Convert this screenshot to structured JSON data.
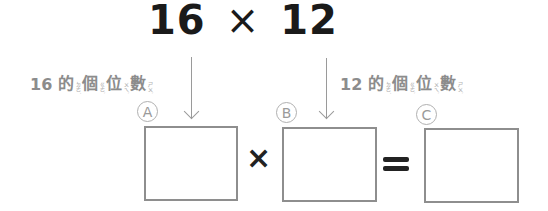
{
  "title": {
    "left": "16",
    "operator": "×",
    "right": "12"
  },
  "labels": [
    {
      "number": "16",
      "chars": [
        {
          "c": "的",
          "zy": "ㄉㄜ˙"
        },
        {
          "c": "個",
          "zy": "ㄍㄜˋ"
        },
        {
          "c": "位",
          "zy": "ㄨㄟˋ"
        },
        {
          "c": "數",
          "zy": "ㄕㄨˋ"
        }
      ]
    },
    {
      "number": "12",
      "chars": [
        {
          "c": "的",
          "zy": "ㄉㄜ˙"
        },
        {
          "c": "個",
          "zy": "ㄍㄜˋ"
        },
        {
          "c": "位",
          "zy": "ㄨㄟˋ"
        },
        {
          "c": "數",
          "zy": "ㄕㄨˋ"
        }
      ]
    }
  ],
  "boxes": [
    {
      "marker": "A"
    },
    {
      "marker": "B"
    },
    {
      "marker": "C"
    }
  ],
  "equation": {
    "multiply": "×",
    "equals": "="
  },
  "colors": {
    "text_dark": "#1a1a1a",
    "label_grey": "#8c8c8c",
    "box_border": "#8e8e8e"
  }
}
